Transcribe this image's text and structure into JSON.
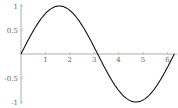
{
  "chart_data": {
    "type": "line",
    "title": "",
    "xlabel": "",
    "ylabel": "",
    "function": "sin(x)",
    "xlim": [
      0,
      6.283
    ],
    "ylim": [
      -1,
      1
    ],
    "grid": false,
    "legend": null,
    "x_ticks": [
      "1",
      "2",
      "3",
      "4",
      "5",
      "6"
    ],
    "y_ticks": [
      "-1",
      "-0.5",
      "0.5",
      "1"
    ],
    "series": [
      {
        "name": "sin(x)",
        "x": [
          0,
          0.5,
          1,
          1.5708,
          2,
          2.5,
          3,
          3.1416,
          3.5,
          4,
          4.7124,
          5,
          5.5,
          6,
          6.2832
        ],
        "values": [
          0,
          0.479,
          0.841,
          1,
          0.909,
          0.598,
          0.141,
          0,
          -0.351,
          -0.757,
          -1,
          -0.959,
          -0.706,
          -0.279,
          0
        ]
      }
    ],
    "color": "#000000"
  }
}
